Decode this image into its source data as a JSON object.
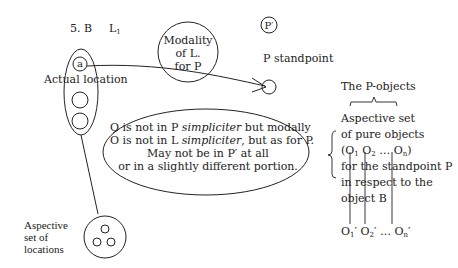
{
  "diagram": {
    "figure_label": "5. B",
    "l1_label": "L",
    "l1_sub": "1",
    "modality_circle": {
      "line1": "Modality",
      "line2": "of L.",
      "line3": "for P"
    },
    "p_prime_label": "P′",
    "p_standpoint_label": "P standpoint",
    "a_label": "a",
    "actual_location_label": "Actual location",
    "central_ellipse": {
      "line1_a": "O is not in P ",
      "line1_b": "simpliciter",
      "line1_c": " but modally",
      "line2_a": "O is not in L ",
      "line2_b": "simpliciter",
      "line2_c": ", but as for P.",
      "line3": "May not be in P′ at all",
      "line4": "or in a slightly different portion."
    },
    "aspective_locations": {
      "line1": "Aspective",
      "line2": "set of",
      "line3": "locations"
    },
    "p_objects_title": "The P-objects",
    "aspective_objects": {
      "line1": "Aspective set",
      "line2": "of pure objects",
      "line3_open": "(O",
      "o1_sub": "1",
      "o2": " O",
      "o2_sub": "2",
      "dots": " … O",
      "on_sub": "n",
      "line3_close": ")",
      "line4": "for the standpoint P",
      "line5": "in respect to the",
      "line6": "object B"
    },
    "primed_objects": {
      "o1": "O",
      "o1_sub": "1",
      "o1_prime": "′",
      "o2": " O",
      "o2_sub": "2",
      "o2_prime": "′",
      "dots": " … O",
      "on_sub": "n",
      "on_prime": "′"
    }
  }
}
